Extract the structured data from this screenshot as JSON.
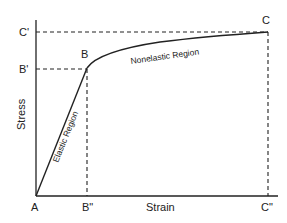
{
  "diagram": {
    "type": "stress-strain-curve",
    "axes": {
      "x_label": "Strain",
      "y_label": "Stress"
    },
    "points": {
      "origin": "A",
      "yield": "B",
      "ultimate": "C"
    },
    "projections": {
      "b_stress": "B'",
      "c_stress": "C'",
      "b_strain": "B\"",
      "c_strain": "C\""
    },
    "regions": {
      "elastic": "Elastic Region",
      "nonelastic": "Nonelastic Region"
    },
    "colors": {
      "line": "#222222",
      "background": "#ffffff"
    }
  }
}
